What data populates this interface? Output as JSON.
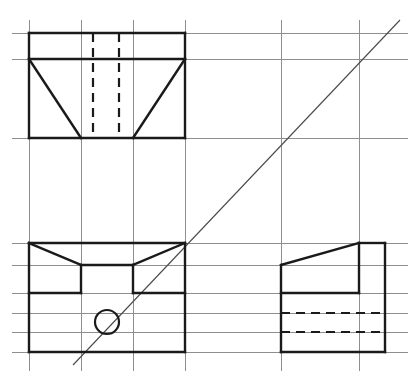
{
  "document": {
    "title": "Orthographic Projection Drawing",
    "type": "engineering-drawing",
    "projection": "third-angle-orthographic",
    "width": 418,
    "height": 377,
    "background_color": "#ffffff"
  },
  "colors": {
    "construction_grid": "#8e8e8e",
    "object_line": "#1a1a1a",
    "hidden_line": "#1a1a1a",
    "miter_line": "#4a4a4a",
    "paper": "#ffffff"
  },
  "line_weights": {
    "grid": 1,
    "object": 2.4,
    "hidden": 2.2,
    "miter": 1.1
  },
  "grid": {
    "vertical_x": [
      29,
      81,
      133,
      185,
      281,
      359
    ],
    "horizontal_y": [
      33,
      59,
      138,
      243,
      265,
      293,
      313,
      332,
      352
    ],
    "vertical_span": [
      20,
      371
    ],
    "horizontal_span": [
      12,
      408
    ]
  },
  "miter": {
    "label": "45-degree miter line",
    "x1": 73,
    "y1": 365,
    "x2": 400,
    "y2": 20
  },
  "views": [
    {
      "name": "front-view",
      "position": "top-left",
      "outline": {
        "x1": 29,
        "y1": 33,
        "x2": 185,
        "y2": 138
      },
      "object_lines": [
        [
          29,
          33,
          185,
          33
        ],
        [
          185,
          33,
          185,
          138
        ],
        [
          185,
          138,
          29,
          138
        ],
        [
          29,
          138,
          29,
          33
        ],
        [
          29,
          59,
          185,
          59
        ],
        [
          29,
          59,
          81,
          138
        ],
        [
          185,
          59,
          133,
          138
        ]
      ],
      "hidden_lines": [
        [
          93,
          33,
          93,
          138
        ],
        [
          119,
          33,
          119,
          138
        ]
      ]
    },
    {
      "name": "top-view",
      "position": "bottom-left",
      "outline": {
        "x1": 29,
        "y1": 243,
        "x2": 185,
        "y2": 352
      },
      "object_lines": [
        [
          29,
          243,
          185,
          243
        ],
        [
          185,
          243,
          185,
          352
        ],
        [
          185,
          352,
          29,
          352
        ],
        [
          29,
          352,
          29,
          243
        ],
        [
          29,
          243,
          81,
          265
        ],
        [
          185,
          243,
          133,
          265
        ],
        [
          81,
          265,
          133,
          265
        ],
        [
          81,
          265,
          81,
          293
        ],
        [
          133,
          265,
          133,
          293
        ],
        [
          29,
          293,
          81,
          293
        ],
        [
          133,
          293,
          185,
          293
        ]
      ],
      "hidden_lines": [],
      "circles": [
        {
          "cx": 107,
          "cy": 322,
          "r": 12
        }
      ]
    },
    {
      "name": "side-view",
      "position": "bottom-right",
      "outline": {
        "x1": 281,
        "y1": 243,
        "x2": 385,
        "y2": 352
      },
      "object_lines": [
        [
          281,
          265,
          359,
          243
        ],
        [
          359,
          243,
          385,
          243
        ],
        [
          385,
          243,
          385,
          352
        ],
        [
          385,
          352,
          281,
          352
        ],
        [
          281,
          352,
          281,
          265
        ],
        [
          359,
          243,
          359,
          293
        ],
        [
          281,
          293,
          359,
          293
        ]
      ],
      "hidden_lines": [
        [
          281,
          313,
          385,
          313
        ],
        [
          281,
          332,
          385,
          332
        ]
      ]
    }
  ]
}
